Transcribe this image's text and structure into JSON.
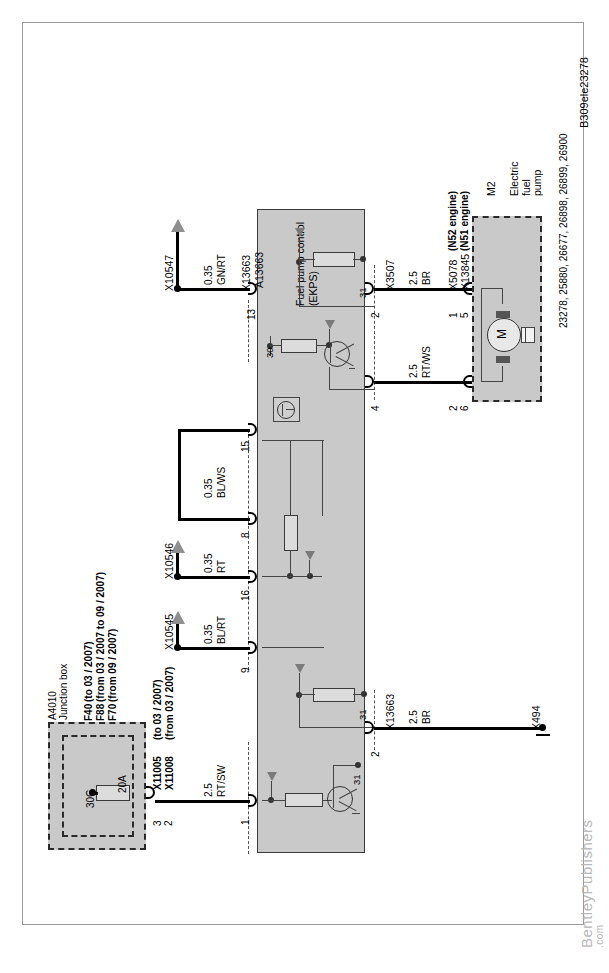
{
  "page": {
    "diagram_id": "B309ele23278",
    "watermark": "BentleyPublishers",
    "watermark_suffix": ".com"
  },
  "modules": {
    "fuel_pump_control": {
      "ref": "A13663",
      "name_line1": "Fuel pump control",
      "name_line2": "(EKPS)"
    },
    "junction_box": {
      "ref": "A4010",
      "name": "Junction box",
      "fuses": [
        {
          "id": "F40",
          "note": "(to 03 / 2007)"
        },
        {
          "id": "F88",
          "note": "(from 03 / 2007 to 09 / 2007)"
        },
        {
          "id": "F70",
          "note": "(from 09 / 2007)"
        }
      ],
      "fuse_rating": "20A",
      "terminal_30g": "30G"
    },
    "electric_fuel_pump": {
      "ref": "M2",
      "name_line1": "Electric",
      "name_line2": "fuel",
      "name_line3": "pump",
      "motor_symbol": "M",
      "part_numbers": "23278, 25880, 26677, 26898, 26899, 26900"
    }
  },
  "connectors": {
    "x10547": "X10547",
    "x10546": "X10546",
    "x10545": "X10545",
    "x13663_top": "X13663",
    "x13663_bottom": "X13663",
    "x3507": "X3507",
    "x5078": "X5078",
    "x13845": "X13845",
    "x5078_note": "(N52 engine)",
    "x13845_note": "(N51 engine)",
    "x494": "X494",
    "x11005": "X11005",
    "x11005_note": "(to 03 / 2007)",
    "x11008": "X11008",
    "x11008_note": "(from 03 / 2007)"
  },
  "wires": [
    {
      "id": "w13",
      "gauge": "0.35",
      "color": "GN/RT",
      "pin": "13"
    },
    {
      "id": "w15",
      "gauge": "0.35",
      "color": "BL/WS",
      "pin": "15"
    },
    {
      "id": "w8",
      "gauge": "",
      "color": "",
      "pin": "8"
    },
    {
      "id": "w16",
      "gauge": "0.35",
      "color": "RT",
      "pin": "16"
    },
    {
      "id": "w9",
      "gauge": "0.35",
      "color": "BL/RT",
      "pin": "9"
    },
    {
      "id": "w1",
      "gauge": "2.5",
      "color": "RT/SW",
      "pin": "1"
    },
    {
      "id": "w2b",
      "gauge": "2.5",
      "color": "BR",
      "pin": "2"
    },
    {
      "id": "w2t",
      "gauge": "2.5",
      "color": "BR",
      "pin": "2"
    },
    {
      "id": "w4",
      "gauge": "2.5",
      "color": "RT/WS",
      "pin": "4"
    }
  ],
  "pins": {
    "p13": "13",
    "p15": "15",
    "p8": "8",
    "p16": "16",
    "p9": "9",
    "p1": "1",
    "p2_bottom": "2",
    "p2_top": "2",
    "p4": "4",
    "pump_a_1": "1",
    "pump_a_5": "5",
    "pump_b_2": "2",
    "pump_b_6": "6",
    "fuse_3": "3",
    "fuse_2": "2"
  },
  "internal_labels": {
    "t30": "30",
    "t31_top": "31",
    "t31_mid": "31",
    "t31_bottom": "31"
  }
}
